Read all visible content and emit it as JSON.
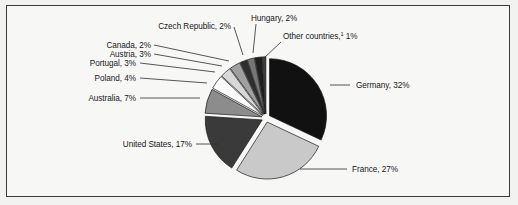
{
  "figure": {
    "frame": {
      "border_color": "#3b3b3b",
      "background": "#f7f7f6"
    },
    "page_background": "#f2f2f1"
  },
  "chart_data": {
    "type": "pie",
    "title": "",
    "subtitle": "",
    "xlabel": "",
    "ylabel": "",
    "legend_position": "none",
    "exploded": true,
    "start_angle_deg": 0,
    "direction": "clockwise",
    "unit": "%",
    "total": 100,
    "categories": [
      "Germany",
      "France",
      "United States",
      "Australia",
      "Poland",
      "Portugal",
      "Austria",
      "Canada",
      "Czech Republic",
      "Hungary",
      "Other countries"
    ],
    "values": [
      32,
      27,
      17,
      7,
      4,
      3,
      3,
      2,
      2,
      2,
      1
    ],
    "slices": [
      {
        "label": "Germany, 32%",
        "name": "Germany",
        "value": 32,
        "color": "#111111",
        "label_x": 356,
        "label_y": 88,
        "anchor": "start",
        "leader": "M 330 85 L 350 85"
      },
      {
        "label": "France, 27%",
        "name": "France",
        "value": 27,
        "color": "#c9c9c9",
        "label_x": 352,
        "label_y": 172,
        "anchor": "start",
        "leader": "M 300 169 L 347 169"
      },
      {
        "label": "United States, 17%",
        "name": "United States",
        "value": 17,
        "color": "#3a3a3a",
        "label_x": 192,
        "label_y": 147,
        "anchor": "end",
        "leader": "M 196 144 L 218 144"
      },
      {
        "label": "Australia, 7%",
        "name": "Australia",
        "value": 7,
        "color": "#8c8c8c",
        "label_x": 136,
        "label_y": 101,
        "anchor": "end",
        "leader": "M 140 98 L 200 98"
      },
      {
        "label": "Poland, 4%",
        "name": "Poland",
        "value": 4,
        "color": "#fbfbfb",
        "label_x": 136,
        "label_y": 81,
        "anchor": "end",
        "leader": "M 140 78 L 207 83"
      },
      {
        "label": "Portugal, 3%",
        "name": "Portugal",
        "value": 3,
        "color": "#d8d8d8",
        "label_x": 136,
        "label_y": 66,
        "anchor": "end",
        "leader": "M 140 63 L 215 72"
      },
      {
        "label": "Austria, 3%",
        "name": "Austria",
        "value": 3,
        "color": "#a0a0a0",
        "label_x": 151,
        "label_y": 57,
        "anchor": "end",
        "leader": "M 154 54 L 222 66"
      },
      {
        "label": "Canada, 2%",
        "name": "Canada",
        "value": 2,
        "color": "#2e2e2e",
        "label_x": 151,
        "label_y": 48,
        "anchor": "end",
        "leader": "M 154 45 L 229 61"
      },
      {
        "label": "Czech Republic, 2%",
        "name": "Czech Republic",
        "value": 2,
        "color": "#767676",
        "label_x": 231,
        "label_y": 29,
        "anchor": "end",
        "leader": "M 234 27 L 243 55"
      },
      {
        "label": "Hungary, 2%",
        "name": "Hungary",
        "value": 2,
        "color": "#1f1f1f",
        "label_x": 251,
        "label_y": 21,
        "anchor": "start",
        "leader": "M 256 24 L 253 53"
      },
      {
        "label": "Other countries,",
        "label_sup": "1",
        "label_tail": " 1%",
        "name": "Other countries",
        "value": 1,
        "color": "#3f3f3f",
        "label_x": 283,
        "label_y": 39,
        "anchor": "start",
        "leader": "M 264 58 L 281 42"
      }
    ]
  }
}
